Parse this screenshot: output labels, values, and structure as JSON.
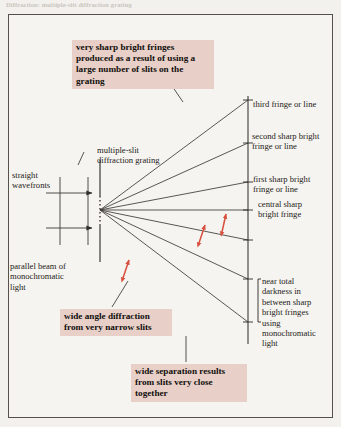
{
  "page": {
    "bleed_header": "Diffraction: multiple-slit diffraction grating",
    "background_color": "#f3f1ed",
    "frame_color": "#55524c",
    "callout_color": "#e8cfc7",
    "arrow_color": "#d94f3d",
    "ray_color": "#3c3a36"
  },
  "labels": {
    "straight_wavefronts": "straight\nwavefronts",
    "diffraction_grating": "multiple-slit\ndiffraction grating",
    "parallel_beam": "parallel beam of\nmonochromatic\nlight",
    "third_fringe": "third fringe or line",
    "second_fringe": "second sharp bright\nfringe or line",
    "first_fringe": "first sharp bright\nfringe or line",
    "central_fringe": "central sharp\nbright fringe",
    "near_total_darkness": "near total\ndarkness in\nbetween sharp\nbright fringes\nusing\nmonochromatic\nlight"
  },
  "callouts": {
    "very_sharp_fringes": "very sharp bright fringes produced as a result of using a large number of slits on the grating",
    "wide_angle_diffraction": "wide angle diffraction from very narrow slits",
    "wide_separation": "wide separation results from slits very close together"
  },
  "diagram": {
    "type": "optics-ray-diagram",
    "grating_x": 100,
    "grating_y_top": 175,
    "grating_y_bottom": 248,
    "ray_origin": [
      100,
      210
    ],
    "screen_x": 248,
    "screen_y_top": 96,
    "screen_y_bottom": 344,
    "fringe_positions_y": [
      100,
      143,
      182,
      210,
      240,
      279,
      322
    ],
    "wavefront_lines_y": [
      193,
      228
    ],
    "wavefront_count": 2,
    "angle_markers": 3
  }
}
